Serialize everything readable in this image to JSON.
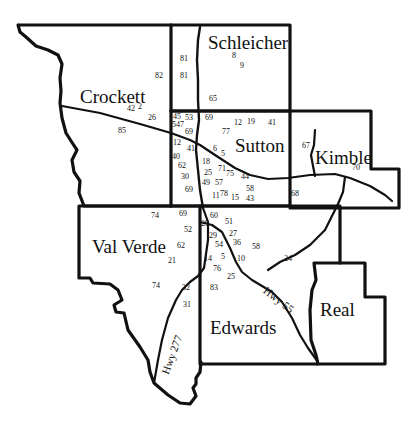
{
  "map": {
    "background": "#ffffff",
    "line_color": "#111111",
    "counties": [
      {
        "name": "Crockett",
        "x": 80,
        "y": 87
      },
      {
        "name": "Schleicher",
        "x": 208,
        "y": 33
      },
      {
        "name": "Sutton",
        "x": 235,
        "y": 136
      },
      {
        "name": "Kimble",
        "x": 315,
        "y": 148
      },
      {
        "name": "Val Verde",
        "x": 92,
        "y": 237
      },
      {
        "name": "Edwards",
        "x": 210,
        "y": 318
      },
      {
        "name": "Real",
        "x": 320,
        "y": 300
      }
    ],
    "highways": [
      {
        "name": "Hwy 277",
        "x": 160,
        "y": 372,
        "rotate": -70
      },
      {
        "name": "Hwy 55",
        "x": 268,
        "y": 285,
        "rotate": 38
      }
    ],
    "sites": [
      {
        "id": "81",
        "x": 180,
        "y": 55
      },
      {
        "id": "81",
        "x": 180,
        "y": 72
      },
      {
        "id": "82",
        "x": 155,
        "y": 72
      },
      {
        "id": "42",
        "x": 127,
        "y": 105
      },
      {
        "id": "2",
        "x": 138,
        "y": 103
      },
      {
        "id": "26",
        "x": 148,
        "y": 114
      },
      {
        "id": "85",
        "x": 118,
        "y": 127
      },
      {
        "id": "8",
        "x": 232,
        "y": 52
      },
      {
        "id": "9",
        "x": 240,
        "y": 62
      },
      {
        "id": "65",
        "x": 209,
        "y": 95
      },
      {
        "id": "45",
        "x": 173,
        "y": 113
      },
      {
        "id": "53",
        "x": 185,
        "y": 114
      },
      {
        "id": "547",
        "x": 172,
        "y": 121
      },
      {
        "id": "69",
        "x": 185,
        "y": 128
      },
      {
        "id": "69",
        "x": 205,
        "y": 114
      },
      {
        "id": "12",
        "x": 234,
        "y": 119
      },
      {
        "id": "19",
        "x": 247,
        "y": 118
      },
      {
        "id": "41",
        "x": 268,
        "y": 119
      },
      {
        "id": "77",
        "x": 222,
        "y": 128
      },
      {
        "id": "12",
        "x": 173,
        "y": 139
      },
      {
        "id": "41",
        "x": 187,
        "y": 145
      },
      {
        "id": "6",
        "x": 213,
        "y": 145
      },
      {
        "id": "5",
        "x": 221,
        "y": 150
      },
      {
        "id": "40",
        "x": 172,
        "y": 153
      },
      {
        "id": "62",
        "x": 178,
        "y": 162
      },
      {
        "id": "18",
        "x": 202,
        "y": 158
      },
      {
        "id": "71",
        "x": 218,
        "y": 165
      },
      {
        "id": "25",
        "x": 204,
        "y": 169
      },
      {
        "id": "75",
        "x": 226,
        "y": 170
      },
      {
        "id": "44",
        "x": 241,
        "y": 173
      },
      {
        "id": "30",
        "x": 181,
        "y": 173
      },
      {
        "id": "49",
        "x": 202,
        "y": 179
      },
      {
        "id": "57",
        "x": 215,
        "y": 179
      },
      {
        "id": "58",
        "x": 246,
        "y": 185
      },
      {
        "id": "69",
        "x": 185,
        "y": 186
      },
      {
        "id": "11",
        "x": 212,
        "y": 192
      },
      {
        "id": "78",
        "x": 220,
        "y": 190
      },
      {
        "id": "15",
        "x": 231,
        "y": 194
      },
      {
        "id": "43",
        "x": 246,
        "y": 195
      },
      {
        "id": "67",
        "x": 302,
        "y": 142
      },
      {
        "id": "70",
        "x": 352,
        "y": 164
      },
      {
        "id": "68",
        "x": 291,
        "y": 190
      },
      {
        "id": "74",
        "x": 151,
        "y": 212
      },
      {
        "id": "69",
        "x": 179,
        "y": 210
      },
      {
        "id": "52",
        "x": 184,
        "y": 226
      },
      {
        "id": "62",
        "x": 177,
        "y": 242
      },
      {
        "id": "21",
        "x": 168,
        "y": 257
      },
      {
        "id": "74",
        "x": 152,
        "y": 282
      },
      {
        "id": "32",
        "x": 182,
        "y": 284
      },
      {
        "id": "31",
        "x": 183,
        "y": 301
      },
      {
        "id": "60",
        "x": 210,
        "y": 212
      },
      {
        "id": "51",
        "x": 225,
        "y": 218
      },
      {
        "id": "29",
        "x": 201,
        "y": 220
      },
      {
        "id": "29",
        "x": 209,
        "y": 232
      },
      {
        "id": "27",
        "x": 229,
        "y": 230
      },
      {
        "id": "54",
        "x": 215,
        "y": 241
      },
      {
        "id": "36",
        "x": 233,
        "y": 239
      },
      {
        "id": "58",
        "x": 252,
        "y": 243
      },
      {
        "id": "14",
        "x": 204,
        "y": 255
      },
      {
        "id": "5",
        "x": 221,
        "y": 253
      },
      {
        "id": "10",
        "x": 237,
        "y": 255
      },
      {
        "id": "24",
        "x": 284,
        "y": 255
      },
      {
        "id": "76",
        "x": 213,
        "y": 265
      },
      {
        "id": "25",
        "x": 227,
        "y": 273
      },
      {
        "id": "83",
        "x": 210,
        "y": 284
      }
    ]
  }
}
